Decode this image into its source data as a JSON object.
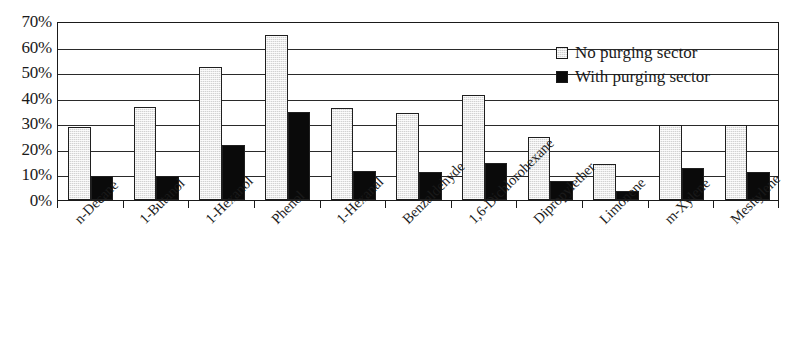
{
  "chart_data": {
    "type": "bar",
    "title": "",
    "subtitle": "",
    "xlabel": "",
    "ylabel": "",
    "ylim": [
      0,
      70
    ],
    "y_tick_labels": [
      "70%",
      "60%",
      "50%",
      "40%",
      "30%",
      "20%",
      "10%",
      "0%"
    ],
    "y_tick_values": [
      70,
      60,
      50,
      40,
      30,
      20,
      10,
      0
    ],
    "grid": true,
    "grid_axis": "y",
    "legend_position": "top-right",
    "categories": [
      "n-Decane",
      "1-Butanol",
      "1-Hexanol",
      "Phenol",
      "1-Hexanal",
      "Benzaldehyde",
      "1,6-Dichlorohexane",
      "Dipropylether",
      "Limonene",
      "m-Xylene",
      "Mesitylene"
    ],
    "series": [
      {
        "name": "No purging sector",
        "color": "#d2d2d2",
        "values": [
          28.5,
          36.5,
          52.0,
          64.5,
          36.0,
          34.0,
          41.0,
          24.5,
          14.0,
          29.5,
          29.5
        ]
      },
      {
        "name": "With purging sector",
        "color": "#0a0a0a",
        "values": [
          9.5,
          9.5,
          21.5,
          34.5,
          11.5,
          11.0,
          14.5,
          7.5,
          3.5,
          12.5,
          11.0
        ]
      }
    ]
  },
  "legend": {
    "items": [
      {
        "label": "No purging sector",
        "swatch": "light-gray-square"
      },
      {
        "label": "With purging sector",
        "swatch": "black-square"
      }
    ]
  }
}
